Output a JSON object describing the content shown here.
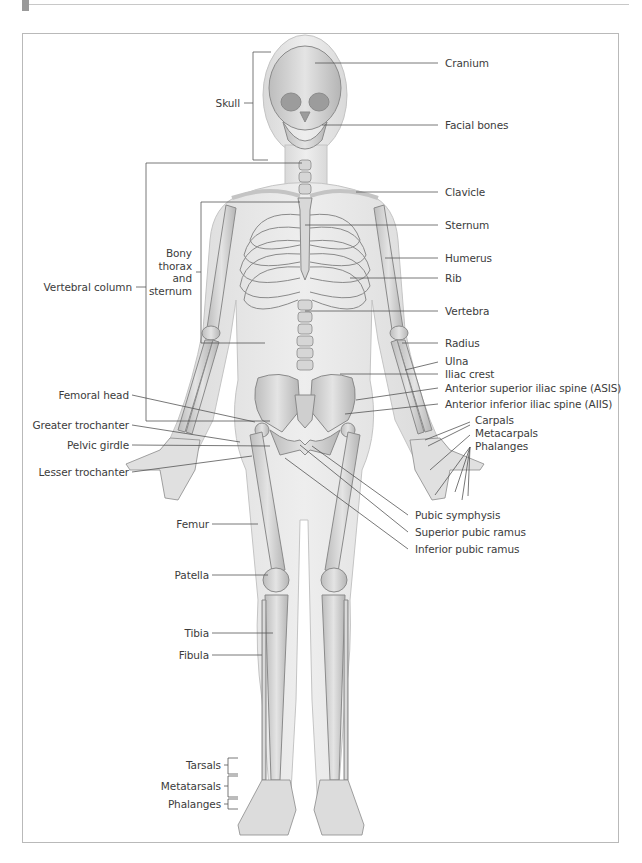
{
  "header": {
    "tab_color": "#9a9a9a",
    "rule_color": "#c8c8c8"
  },
  "figure": {
    "frame_color": "#b9b9b9",
    "skin_color": "#e6e6e6",
    "bone_color": "#d2d2d2",
    "bone_stroke": "#8a8a8a",
    "leader_color": "#555555"
  },
  "labels": {
    "right": {
      "cranium": "Cranium",
      "facial_bones": "Facial bones",
      "clavicle": "Clavicle",
      "sternum": "Sternum",
      "humerus": "Humerus",
      "rib": "Rib",
      "vertebra": "Vertebra",
      "radius": "Radius",
      "ulna": "Ulna",
      "iliac_crest": "Iliac crest",
      "asis": "Anterior superior iliac spine (ASIS)",
      "aiis": "Anterior inferior iliac spine (AIIS)",
      "carpals": "Carpals",
      "metacarpals": "Metacarpals",
      "hand_phalanges": "Phalanges",
      "pubic_symphysis": "Pubic symphysis",
      "superior_pubic_ramus": "Superior pubic ramus",
      "inferior_pubic_ramus": "Inferior pubic ramus"
    },
    "left": {
      "skull": "Skull",
      "bony_thorax": "Bony thorax and sternum",
      "vertebral_column": "Vertebral column",
      "femoral_head": "Femoral head",
      "greater_trochanter": "Greater trochanter",
      "pelvic_girdle": "Pelvic girdle",
      "lesser_trochanter": "Lesser trochanter",
      "femur": "Femur",
      "patella": "Patella",
      "tibia": "Tibia",
      "fibula": "Fibula",
      "tarsals": "Tarsals",
      "metatarsals": "Metatarsals",
      "foot_phalanges": "Phalanges"
    }
  }
}
